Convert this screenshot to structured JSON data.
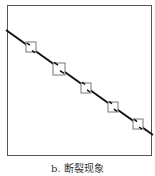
{
  "figure": {
    "caption": "b. 断裂现象",
    "frame": {
      "x": 7,
      "y": 5,
      "w": 144,
      "h": 150,
      "stroke": "#555555"
    },
    "line": {
      "x1": 6,
      "y1": 30,
      "x2": 153,
      "y2": 135,
      "stroke": "#111111",
      "width": 2
    },
    "boxes": [
      {
        "cx": 31,
        "cy": 47,
        "size": 10
      },
      {
        "cx": 59,
        "cy": 69,
        "size": 12
      },
      {
        "cx": 86,
        "cy": 88,
        "size": 10
      },
      {
        "cx": 113,
        "cy": 107,
        "size": 10
      },
      {
        "cx": 138,
        "cy": 124,
        "size": 10
      }
    ],
    "box_stroke": "#777777"
  }
}
